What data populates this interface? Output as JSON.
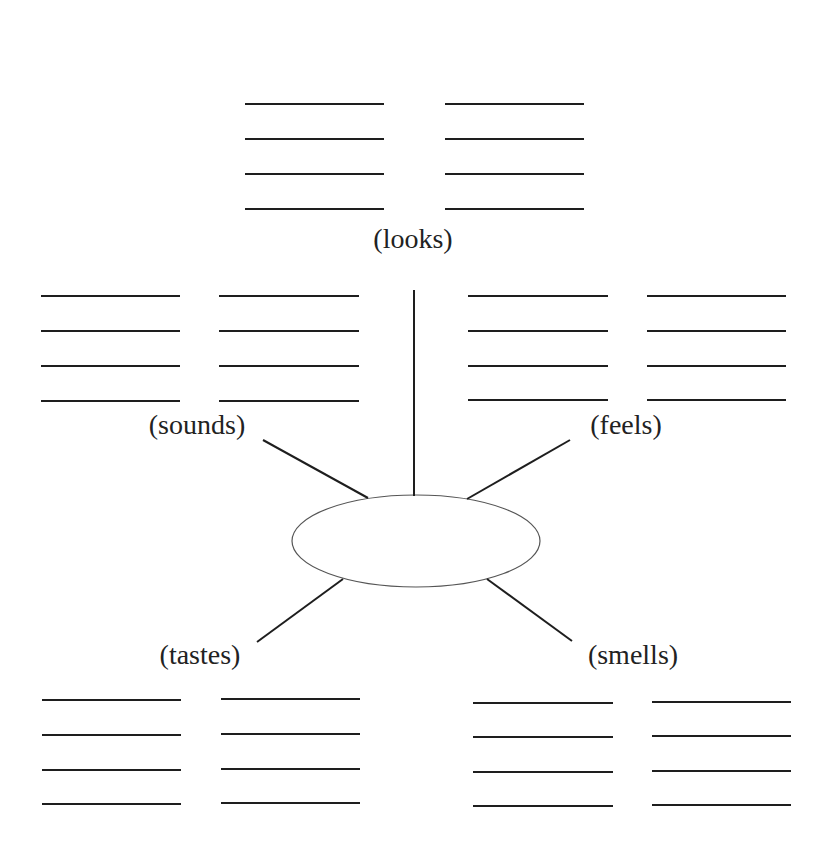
{
  "diagram": {
    "type": "sensory-web",
    "center": {
      "label": "",
      "cx": 416,
      "cy": 541,
      "rx": 124,
      "ry": 46
    },
    "branches": [
      {
        "id": "looks",
        "label": "(looks)",
        "label_x": 413,
        "label_y": 248,
        "spoke": [
          414,
          290,
          414,
          496
        ],
        "blank_groups": [
          {
            "x1": 245,
            "x2": 384,
            "ys": [
              104,
              139,
              174,
              209
            ]
          },
          {
            "x1": 445,
            "x2": 584,
            "ys": [
              104,
              139,
              174,
              209
            ]
          }
        ]
      },
      {
        "id": "sounds",
        "label": "(sounds)",
        "label_x": 197,
        "label_y": 434,
        "spoke": [
          263,
          440,
          368,
          498
        ],
        "blank_groups": [
          {
            "x1": 41,
            "x2": 180,
            "ys": [
              296,
              331,
              366,
              401
            ]
          },
          {
            "x1": 219,
            "x2": 359,
            "ys": [
              296,
              331,
              366,
              401
            ]
          }
        ]
      },
      {
        "id": "feels",
        "label": "(feels)",
        "label_x": 626,
        "label_y": 434,
        "spoke": [
          570,
          440,
          467,
          499
        ],
        "blank_groups": [
          {
            "x1": 468,
            "x2": 608,
            "ys": [
              296,
              331,
              366,
              400
            ]
          },
          {
            "x1": 647,
            "x2": 786,
            "ys": [
              296,
              331,
              366,
              400
            ]
          }
        ]
      },
      {
        "id": "tastes",
        "label": "(tastes)",
        "label_x": 200,
        "label_y": 664,
        "spoke": [
          343,
          579,
          257,
          642
        ],
        "blank_groups": [
          {
            "x1": 42,
            "x2": 181,
            "ys": [
              700,
              735,
              770,
              804
            ]
          },
          {
            "x1": 221,
            "x2": 360,
            "ys": [
              699,
              734,
              769,
              803
            ]
          }
        ]
      },
      {
        "id": "smells",
        "label": "(smells)",
        "label_x": 633,
        "label_y": 664,
        "spoke": [
          487,
          579,
          572,
          641
        ],
        "blank_groups": [
          {
            "x1": 473,
            "x2": 613,
            "ys": [
              703,
              737,
              772,
              806
            ]
          },
          {
            "x1": 652,
            "x2": 791,
            "ys": [
              702,
              736,
              771,
              805
            ]
          }
        ]
      }
    ],
    "colors": {
      "line": "#1e1e1e",
      "ellipse_stroke": "#555555",
      "text": "#222222",
      "background": "#ffffff"
    }
  }
}
